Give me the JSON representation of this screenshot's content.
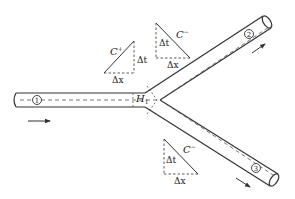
{
  "diagram": {
    "type": "pipe-junction-characteristics",
    "pipes": [
      {
        "id": "1",
        "label": "①",
        "flow_direction": "right"
      },
      {
        "id": "2",
        "label": "②",
        "flow_direction": "up-right"
      },
      {
        "id": "3",
        "label": "③",
        "flow_direction": "down-right"
      }
    ],
    "junction_label": {
      "main": "H",
      "sub": "1"
    },
    "characteristics": [
      {
        "name": "C⁺",
        "label_main": "C",
        "label_sup": "+",
        "dt": "Δt",
        "dx": "Δx"
      },
      {
        "name": "C⁻ (upper)",
        "label_main": "C",
        "label_sup": "−",
        "dt": "Δt",
        "dx": "Δx"
      },
      {
        "name": "C⁻ (lower)",
        "label_main": "C",
        "label_sup": "−",
        "dt": "Δt",
        "dx": "Δx"
      }
    ],
    "colors": {
      "line": "#333333",
      "dash": "#555555",
      "background": "#ffffff"
    }
  }
}
